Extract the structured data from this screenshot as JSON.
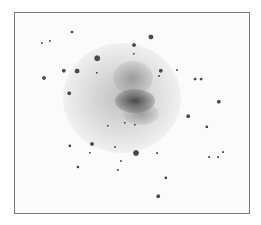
{
  "image": {
    "subject": "galaxy",
    "palette": {
      "border": "#7a7a7a",
      "background": "#fbfbfb",
      "star": "#4a4a4a",
      "core": "#3c3c3c"
    },
    "frame": {
      "x": 14,
      "y": 12,
      "width": 234,
      "height": 200
    },
    "galaxy": {
      "cx": 130,
      "cy": 100,
      "core": {
        "cx": 131,
        "cy": 98
      }
    },
    "stars": [
      {
        "x": 71,
        "y": 31,
        "r": 1.6
      },
      {
        "x": 41,
        "y": 42,
        "r": 1.1
      },
      {
        "x": 49,
        "y": 40,
        "r": 1.1
      },
      {
        "x": 150,
        "y": 36,
        "r": 2.6
      },
      {
        "x": 133,
        "y": 44,
        "r": 2.0
      },
      {
        "x": 133,
        "y": 53,
        "r": 1.2
      },
      {
        "x": 96,
        "y": 57,
        "r": 2.8
      },
      {
        "x": 63,
        "y": 70,
        "r": 2.2
      },
      {
        "x": 76,
        "y": 70,
        "r": 2.4
      },
      {
        "x": 43,
        "y": 77,
        "r": 2.0
      },
      {
        "x": 96,
        "y": 72,
        "r": 1.2
      },
      {
        "x": 68,
        "y": 92,
        "r": 1.8
      },
      {
        "x": 160,
        "y": 70,
        "r": 2.2
      },
      {
        "x": 158,
        "y": 75,
        "r": 1.0
      },
      {
        "x": 176,
        "y": 69,
        "r": 1.0
      },
      {
        "x": 194,
        "y": 78,
        "r": 1.4
      },
      {
        "x": 200,
        "y": 78,
        "r": 1.4
      },
      {
        "x": 218,
        "y": 101,
        "r": 2.2
      },
      {
        "x": 187,
        "y": 115,
        "r": 1.8
      },
      {
        "x": 206,
        "y": 126,
        "r": 1.7
      },
      {
        "x": 107,
        "y": 125,
        "r": 1.2
      },
      {
        "x": 124,
        "y": 122,
        "r": 1.2
      },
      {
        "x": 134,
        "y": 124,
        "r": 1.2
      },
      {
        "x": 69,
        "y": 145,
        "r": 1.7
      },
      {
        "x": 91,
        "y": 143,
        "r": 2.0
      },
      {
        "x": 89,
        "y": 152,
        "r": 1.2
      },
      {
        "x": 114,
        "y": 146,
        "r": 1.0
      },
      {
        "x": 135,
        "y": 152,
        "r": 3.0
      },
      {
        "x": 156,
        "y": 152,
        "r": 0.9
      },
      {
        "x": 120,
        "y": 160,
        "r": 1.1
      },
      {
        "x": 77,
        "y": 166,
        "r": 1.6
      },
      {
        "x": 117,
        "y": 169,
        "r": 1.1
      },
      {
        "x": 165,
        "y": 177,
        "r": 1.7
      },
      {
        "x": 157,
        "y": 195,
        "r": 1.8
      },
      {
        "x": 208,
        "y": 156,
        "r": 0.9
      },
      {
        "x": 217,
        "y": 156,
        "r": 0.9
      },
      {
        "x": 222,
        "y": 151,
        "r": 0.9
      }
    ]
  }
}
